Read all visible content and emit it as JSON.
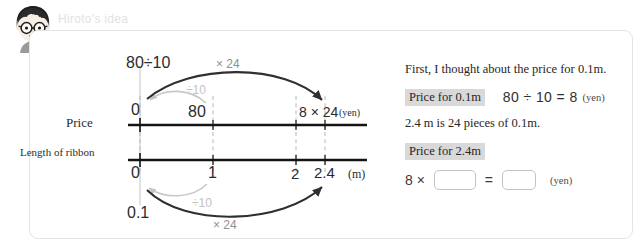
{
  "header": {
    "title": "Hiroto's idea",
    "avatar_name": "boy-avatar"
  },
  "diagram": {
    "row_labels": {
      "price": "Price",
      "ribbon": "Length of ribbon"
    },
    "top_formula": "80÷10",
    "arrows": {
      "top_multiply": "× 24",
      "top_divide": "÷10",
      "bottom_divide": "÷10",
      "bottom_multiply": "× 24"
    },
    "price_axis": {
      "zero": "0",
      "eighty": "80",
      "expression": "8 × 24",
      "unit": "(yen)"
    },
    "ribbon_axis": {
      "zero": "0",
      "one": "1",
      "two": "2",
      "two_point_four": "2.4",
      "unit": "(m)"
    },
    "bottom_value": "0.1"
  },
  "explanation": {
    "intro": "First, I thought about the price for 0.1m.",
    "step1": {
      "tag": "Price for 0.1m",
      "equation": "80 ÷ 10 = 8",
      "unit": "(yen)"
    },
    "note": "2.4 m is 24 pieces of 0.1m.",
    "step2": {
      "tag": "Price for 2.4m",
      "lead": "8 ×",
      "equals": "=",
      "unit": "(yen)",
      "blank1_value": "",
      "blank2_value": ""
    }
  },
  "colors": {
    "panel_border": "#e4e4e4",
    "tag_bg": "#d9d9d9",
    "header_text": "#e2e2e2",
    "dark_arrow": "#2f2f2f",
    "light_arrow": "#c8c8c8"
  }
}
